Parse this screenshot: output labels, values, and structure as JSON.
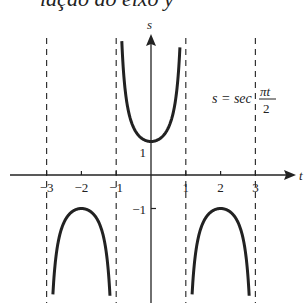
{
  "caption": "lação ao eixo y",
  "chart_data": {
    "type": "line",
    "title": "",
    "function": "s = sec(πt/2)",
    "equation_label": {
      "lhs": "s = sec",
      "num": "πt",
      "den": "2"
    },
    "xlabel": "t",
    "ylabel": "s",
    "x_ticks": [
      -3,
      -2,
      -1,
      1,
      2,
      3
    ],
    "x_tick_labels": [
      "−3",
      "−2",
      "−1",
      "1",
      "2",
      "3"
    ],
    "y_ticks": [
      1,
      -1
    ],
    "y_tick_labels": [
      "1",
      "−1"
    ],
    "asymptotes": [
      -3,
      -1,
      1,
      3
    ],
    "xlim": [
      -3.3,
      4.2
    ],
    "ylim": [
      -3.7,
      4.1
    ],
    "grid": false,
    "branches": [
      {
        "domain": [
          -3,
          -1
        ],
        "extremum": {
          "t": -2,
          "s": -1
        },
        "type": "local max"
      },
      {
        "domain": [
          -1,
          1
        ],
        "extremum": {
          "t": 0,
          "s": 1
        },
        "type": "local min"
      },
      {
        "domain": [
          1,
          3
        ],
        "extremum": {
          "t": 2,
          "s": -1
        },
        "type": "local max"
      }
    ]
  }
}
